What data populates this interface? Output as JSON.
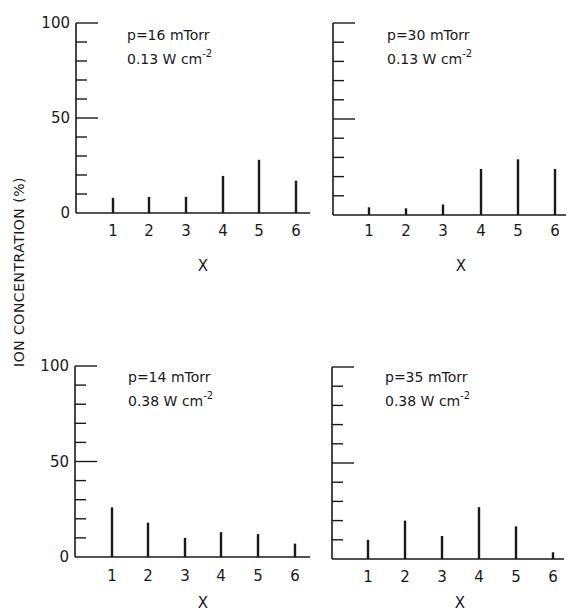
{
  "figure": {
    "ylabel": "ION CONCENTRATION (%)",
    "ink_color": "#1a1a1a",
    "background": "#ffffff"
  },
  "chart_data": [
    {
      "type": "bar",
      "panel": "top-left",
      "annotation": [
        "p=16 mTorr",
        "0.13 W cm",
        "-2"
      ],
      "xlabel": "X",
      "ylabel": "ION CONCENTRATION (%)",
      "categories": [
        "1",
        "2",
        "3",
        "4",
        "5",
        "6"
      ],
      "values": [
        8,
        8.5,
        8.5,
        19.5,
        28,
        17
      ],
      "yticks": [
        "0",
        "50",
        "100"
      ],
      "ylim": [
        0,
        100
      ],
      "grid": false
    },
    {
      "type": "bar",
      "panel": "top-right",
      "annotation": [
        "p=30 mTorr",
        "0.13 W cm",
        "-2"
      ],
      "xlabel": "X",
      "ylabel": "ION CONCENTRATION (%)",
      "categories": [
        "1",
        "2",
        "3",
        "4",
        "5",
        "6"
      ],
      "values": [
        4,
        3.5,
        5.5,
        24,
        29,
        24
      ],
      "yticks": [],
      "ylim": [
        0,
        100
      ],
      "grid": false
    },
    {
      "type": "bar",
      "panel": "bottom-left",
      "annotation": [
        "p=14 mTorr",
        "0.38 W cm",
        "-2"
      ],
      "xlabel": "X",
      "ylabel": "ION CONCENTRATION (%)",
      "categories": [
        "1",
        "2",
        "3",
        "4",
        "5",
        "6"
      ],
      "values": [
        26,
        18,
        10,
        13,
        12,
        7
      ],
      "yticks": [
        "0",
        "50",
        "100"
      ],
      "ylim": [
        0,
        100
      ],
      "grid": false
    },
    {
      "type": "bar",
      "panel": "bottom-right",
      "annotation": [
        "p=35 mTorr",
        "0.38 W cm",
        "-2"
      ],
      "xlabel": "X",
      "ylabel": "ION CONCENTRATION (%)",
      "categories": [
        "1",
        "2",
        "3",
        "4",
        "5",
        "6"
      ],
      "values": [
        10,
        20,
        12,
        27,
        17,
        3.5
      ],
      "yticks": [],
      "ylim": [
        0,
        100
      ],
      "grid": false
    }
  ],
  "layout": {
    "panels": [
      {
        "x0": 76,
        "x1": 310,
        "y0": 213,
        "y100": 23,
        "bar_x": [
          113,
          149,
          186,
          223,
          259,
          296
        ],
        "ann_x": 127,
        "ann_y": 40,
        "xlabel_x": 203,
        "xlabel_y": 271,
        "ticklabel_y": 236
      },
      {
        "x0": 333,
        "x1": 566,
        "y0": 215,
        "y100": 23,
        "bar_x": [
          369,
          406,
          443,
          481,
          518,
          555
        ],
        "ann_x": 387,
        "ann_y": 40,
        "xlabel_x": 461,
        "xlabel_y": 271,
        "ticklabel_y": 236
      },
      {
        "x0": 75,
        "x1": 310,
        "y0": 557,
        "y100": 366,
        "bar_x": [
          112,
          148,
          185,
          221,
          258,
          295
        ],
        "ann_x": 128,
        "ann_y": 382,
        "xlabel_x": 203,
        "xlabel_y": 608,
        "ticklabel_y": 581
      },
      {
        "x0": 332,
        "x1": 564,
        "y0": 559,
        "y100": 367,
        "bar_x": [
          368,
          405,
          442,
          479,
          516,
          553
        ],
        "ann_x": 385,
        "ann_y": 382,
        "xlabel_x": 460,
        "xlabel_y": 608,
        "ticklabel_y": 582
      }
    ]
  }
}
